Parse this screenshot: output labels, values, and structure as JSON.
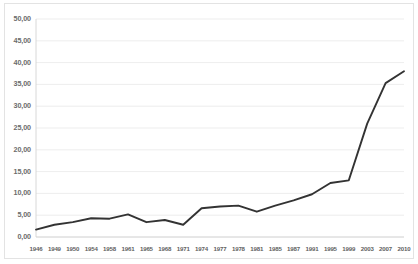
{
  "chart_data": {
    "type": "line",
    "title": "",
    "subtitle": "",
    "xlabel": "",
    "ylabel": "",
    "grid": true,
    "legend": false,
    "legend_position": "none",
    "decimal_separator": ",",
    "line_color": "#333333",
    "grid_color": "#e8e8e8",
    "axis_color": "#d4d4d4",
    "background_color": "#ffffff",
    "ylim": [
      0,
      50
    ],
    "ytick_step": 5,
    "ytick_labels": [
      "50,00",
      "45,00",
      "40,00",
      "35,00",
      "30,00",
      "25,00",
      "20,00",
      "15,00",
      "10,00",
      "5,00",
      "0,00"
    ],
    "ytick_values": [
      50,
      45,
      40,
      35,
      30,
      25,
      20,
      15,
      10,
      5,
      0
    ],
    "categories": [
      "1946",
      "1949",
      "1950",
      "1954",
      "1958",
      "1961",
      "1965",
      "1968",
      "1971",
      "1974",
      "1977",
      "1978",
      "1981",
      "1985",
      "1987",
      "1991",
      "1995",
      "1999",
      "2003",
      "2007",
      "2010"
    ],
    "values": [
      1.7,
      2.8,
      3.4,
      4.3,
      4.2,
      5.2,
      3.4,
      3.9,
      2.8,
      6.6,
      7.0,
      7.2,
      5.8,
      7.2,
      8.4,
      9.8,
      12.4,
      13.0,
      26.0,
      35.3,
      38.0
    ]
  }
}
